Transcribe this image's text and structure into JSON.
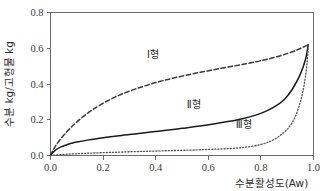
{
  "chart_data": {
    "type": "line",
    "title": "",
    "xlabel": "수분활성도(Aw)",
    "ylabel": "수분 kg/고형물 kg",
    "xlim": [
      0.0,
      1.0
    ],
    "ylim": [
      0.0,
      0.8
    ],
    "xticks": [
      "0.0",
      "0.2",
      "0.4",
      "0.6",
      "0.8",
      "1.0"
    ],
    "xtick_values": [
      0.0,
      0.2,
      0.4,
      0.6,
      0.8,
      1.0
    ],
    "yticks": [
      "0.0",
      "0.2",
      "0.4",
      "0.6",
      "0.8"
    ],
    "ytick_values": [
      0.0,
      0.2,
      0.4,
      0.6,
      0.8
    ],
    "grid": false,
    "legend_position": "inline-annotations",
    "convergence_point": [
      0.98,
      0.62
    ],
    "series": [
      {
        "name": "Ⅰ형",
        "label": "Ⅰ형",
        "style": "dashed",
        "color": "#3a3a3a",
        "annotation_x": 0.39,
        "annotation_y": 0.545,
        "x": [
          0.0,
          0.01,
          0.02,
          0.04,
          0.06,
          0.08,
          0.1,
          0.13,
          0.16,
          0.2,
          0.25,
          0.3,
          0.35,
          0.4,
          0.45,
          0.5,
          0.55,
          0.6,
          0.65,
          0.7,
          0.75,
          0.8,
          0.85,
          0.9,
          0.94,
          0.98
        ],
        "y": [
          0.0,
          0.03,
          0.055,
          0.095,
          0.13,
          0.16,
          0.188,
          0.224,
          0.256,
          0.292,
          0.33,
          0.36,
          0.385,
          0.408,
          0.427,
          0.444,
          0.46,
          0.474,
          0.488,
          0.501,
          0.515,
          0.53,
          0.548,
          0.57,
          0.592,
          0.62
        ]
      },
      {
        "name": "Ⅱ형",
        "label": "Ⅱ형",
        "style": "solid",
        "color": "#1a1a1a",
        "annotation_x": 0.545,
        "annotation_y": 0.268,
        "x": [
          0.0,
          0.01,
          0.02,
          0.04,
          0.06,
          0.08,
          0.1,
          0.14,
          0.18,
          0.22,
          0.27,
          0.32,
          0.38,
          0.44,
          0.5,
          0.56,
          0.62,
          0.68,
          0.73,
          0.78,
          0.82,
          0.86,
          0.89,
          0.92,
          0.95,
          0.97,
          0.98
        ],
        "y": [
          0.0,
          0.018,
          0.031,
          0.048,
          0.059,
          0.068,
          0.075,
          0.086,
          0.095,
          0.103,
          0.112,
          0.12,
          0.131,
          0.141,
          0.152,
          0.163,
          0.176,
          0.191,
          0.206,
          0.226,
          0.248,
          0.28,
          0.315,
          0.372,
          0.455,
          0.54,
          0.62
        ]
      },
      {
        "name": "Ⅲ형",
        "label": "Ⅲ형",
        "style": "dotted",
        "color": "#555555",
        "annotation_x": 0.735,
        "annotation_y": 0.155,
        "x": [
          0.0,
          0.05,
          0.1,
          0.15,
          0.2,
          0.25,
          0.3,
          0.35,
          0.4,
          0.45,
          0.5,
          0.55,
          0.6,
          0.64,
          0.68,
          0.72,
          0.76,
          0.8,
          0.83,
          0.86,
          0.89,
          0.91,
          0.93,
          0.95,
          0.965,
          0.975,
          0.98
        ],
        "y": [
          0.0,
          0.006,
          0.01,
          0.013,
          0.016,
          0.018,
          0.021,
          0.023,
          0.025,
          0.027,
          0.029,
          0.031,
          0.034,
          0.036,
          0.039,
          0.043,
          0.05,
          0.062,
          0.076,
          0.098,
          0.132,
          0.165,
          0.215,
          0.3,
          0.4,
          0.51,
          0.62
        ]
      }
    ]
  },
  "axes": {
    "x_title": "수분활성도(Aw)",
    "y_title": "수분 kg/고형물 kg"
  }
}
